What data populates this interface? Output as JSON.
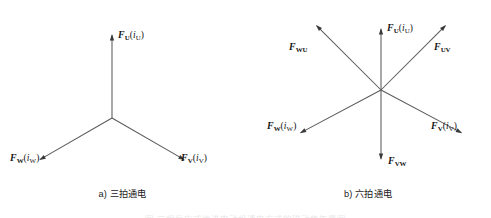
{
  "figure": {
    "background_color": "#ffffff",
    "line_color": "#5a5a5a",
    "arrow_color": "#3a3a3a",
    "text_color": "#141414",
    "width": 491,
    "height": 218
  },
  "panels": [
    {
      "id": "a",
      "caption": "a) 三拍通电",
      "center": {
        "x": 112,
        "y": 118
      },
      "vectors": [
        {
          "name": "F-U",
          "symbol": "F",
          "subscript": "U",
          "current_symbol": "i",
          "current_subscript": "U",
          "label_text": "FU(iU)",
          "angle_deg": 90,
          "length": 84,
          "label_pos": {
            "x": 118,
            "y": 30
          }
        },
        {
          "name": "F-W",
          "symbol": "F",
          "subscript": "W",
          "current_symbol": "i",
          "current_subscript": "W",
          "label_text": "FW(iW)",
          "angle_deg": 210,
          "length": 84,
          "label_pos": {
            "x": 10,
            "y": 154
          }
        },
        {
          "name": "F-V",
          "symbol": "F",
          "subscript": "V",
          "current_symbol": "i",
          "current_subscript": "V",
          "label_text": "FV(iV)",
          "angle_deg": 330,
          "length": 84,
          "label_pos": {
            "x": 182,
            "y": 154
          }
        }
      ]
    },
    {
      "id": "b",
      "caption": "b) 六拍通电",
      "center": {
        "x": 136,
        "y": 90
      },
      "vectors": [
        {
          "name": "F-U",
          "symbol": "F",
          "subscript": "U",
          "current_symbol": "i",
          "current_subscript": "U",
          "label_text": "FU(iU)",
          "angle_deg": 90,
          "length": 62,
          "label_pos": {
            "x": 142,
            "y": 24
          }
        },
        {
          "name": "F-UV",
          "symbol": "F",
          "subscript": "UV",
          "current_symbol": "",
          "current_subscript": "",
          "label_text": "FUV",
          "angle_deg": 45,
          "length": 92,
          "label_pos": {
            "x": 190,
            "y": 43
          }
        },
        {
          "name": "F-V",
          "symbol": "F",
          "subscript": "V",
          "current_symbol": "i",
          "current_subscript": "V",
          "label_text": "FV(iV)",
          "angle_deg": 332,
          "length": 92,
          "label_pos": {
            "x": 186,
            "y": 122
          }
        },
        {
          "name": "F-VW",
          "symbol": "F",
          "subscript": "VW",
          "current_symbol": "",
          "current_subscript": "",
          "label_text": "FVW",
          "angle_deg": 270,
          "length": 70,
          "label_pos": {
            "x": 142,
            "y": 157
          }
        },
        {
          "name": "F-W",
          "symbol": "F",
          "subscript": "W",
          "current_symbol": "i",
          "current_subscript": "W",
          "label_text": "FW(iW)",
          "angle_deg": 208,
          "length": 92,
          "label_pos": {
            "x": 24,
            "y": 122
          }
        },
        {
          "name": "F-WU",
          "symbol": "F",
          "subscript": "WU",
          "current_symbol": "",
          "current_subscript": "",
          "label_text": "FWU",
          "angle_deg": 135,
          "length": 92,
          "label_pos": {
            "x": 45,
            "y": 43
          }
        }
      ]
    }
  ],
  "cutoff_caption": "图  三相反应式步进电动机通电方式的磁动势矢量图"
}
